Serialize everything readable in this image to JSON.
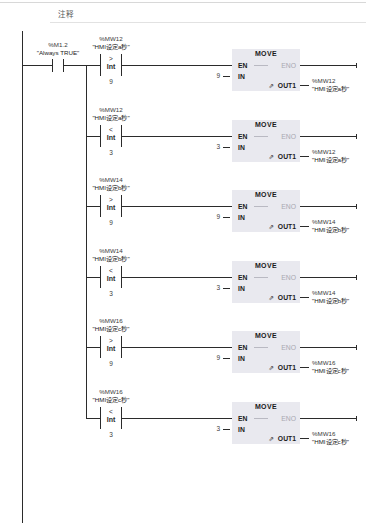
{
  "editor": {
    "comment_label": "注释",
    "network_type": "LAD"
  },
  "rail": {
    "name": "power-rail"
  },
  "start_contact": {
    "address": "%M1.2",
    "symbol": "\"Always TRUE\"",
    "type": "normally-open-contact"
  },
  "move_block": {
    "title": "MOVE",
    "en_label": "EN",
    "eno_label": "ENO",
    "in_label": "IN",
    "out_label": "OUT1",
    "out_prefix": "⇗"
  },
  "rungs": [
    {
      "id": "rung-1",
      "compare": {
        "address": "%MW12",
        "symbol": "\"HMI设定a秒\"",
        "operator": ">",
        "datatype": "Int",
        "operand": "9"
      },
      "move": {
        "in_value": "9",
        "out_address": "%MW12",
        "out_symbol": "\"HMI设定a秒\""
      }
    },
    {
      "id": "rung-2",
      "compare": {
        "address": "%MW12",
        "symbol": "\"HMI设定a秒\"",
        "operator": "<",
        "datatype": "Int",
        "operand": "3"
      },
      "move": {
        "in_value": "3",
        "out_address": "%MW12",
        "out_symbol": "\"HMI设定a秒\""
      }
    },
    {
      "id": "rung-3",
      "compare": {
        "address": "%MW14",
        "symbol": "\"HMI设定b秒\"",
        "operator": ">",
        "datatype": "Int",
        "operand": "9"
      },
      "move": {
        "in_value": "9",
        "out_address": "%MW14",
        "out_symbol": "\"HMI设定b秒\""
      }
    },
    {
      "id": "rung-4",
      "compare": {
        "address": "%MW14",
        "symbol": "\"HMI设定b秒\"",
        "operator": "<",
        "datatype": "Int",
        "operand": "3"
      },
      "move": {
        "in_value": "3",
        "out_address": "%MW14",
        "out_symbol": "\"HMI设定b秒\""
      }
    },
    {
      "id": "rung-5",
      "compare": {
        "address": "%MW16",
        "symbol": "\"HMI设定c秒\"",
        "operator": ">",
        "datatype": "Int",
        "operand": "9"
      },
      "move": {
        "in_value": "9",
        "out_address": "%MW16",
        "out_symbol": "\"HMI设定c秒\""
      }
    },
    {
      "id": "rung-6",
      "compare": {
        "address": "%MW16",
        "symbol": "\"HMI设定c秒\"",
        "operator": "<",
        "datatype": "Int",
        "operand": "3"
      },
      "move": {
        "in_value": "3",
        "out_address": "%MW16",
        "out_symbol": "\"HMI设定c秒\""
      }
    }
  ],
  "colors": {
    "wire": "#2b2b2b",
    "block_fill": "#e9e9ef",
    "disabled_text": "#a8a8b0",
    "rule": "#e2e2e2"
  }
}
